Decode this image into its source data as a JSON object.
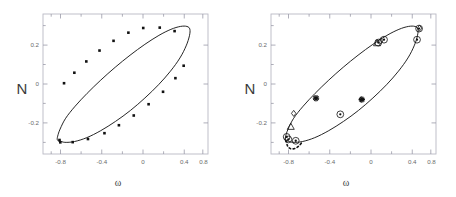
{
  "figure": {
    "background_color": "#ffffff",
    "panel_count": 2,
    "frame_color": "#b9b9c4",
    "curve_color": "#1a1a1a",
    "tick_color": "#9a9aa8",
    "text_color": "#4a4a4a"
  },
  "chart_data": [
    {
      "type": "scatter",
      "panel": "left",
      "title": "",
      "xlabel": "ω",
      "ylabel": "N",
      "xlim": [
        -1.0,
        1.0
      ],
      "ylim": [
        -0.36,
        0.36
      ],
      "xticks": [
        -0.8,
        -0.4,
        0,
        0.4,
        0.8
      ],
      "xticklabels": [
        "-0.8",
        "-0.4",
        "0",
        "0.4",
        "0.8"
      ],
      "yticks": [
        -0.2,
        0,
        0.2
      ],
      "yticklabels": [
        "-0.2",
        "0",
        "0.2"
      ],
      "grid": false,
      "frame": true,
      "minor_ticks": true,
      "series": [
        {
          "name": "limit-cycle-orbit",
          "kind": "closed-curve",
          "linestyle": "solid",
          "color": "#1a1a1a",
          "x": [
            -0.795,
            -0.735,
            -0.62,
            -0.47,
            -0.3,
            -0.12,
            0.06,
            0.235,
            0.4,
            0.545,
            0.66,
            0.735,
            0.775,
            0.78,
            0.745,
            0.665,
            0.55,
            0.405,
            0.235,
            0.055,
            -0.125,
            -0.3,
            -0.465,
            -0.61,
            -0.725,
            -0.793,
            -0.822,
            -0.827,
            -0.812
          ],
          "y": [
            -0.293,
            -0.3,
            -0.296,
            -0.276,
            -0.24,
            -0.192,
            -0.136,
            -0.072,
            -0.004,
            0.066,
            0.134,
            0.196,
            0.248,
            0.282,
            0.296,
            0.296,
            0.281,
            0.25,
            0.204,
            0.148,
            0.086,
            0.02,
            -0.048,
            -0.114,
            -0.176,
            -0.232,
            -0.268,
            -0.286,
            -0.293
          ]
        },
        {
          "name": "sampled-points",
          "kind": "markers",
          "marker": "filled-square",
          "color": "#111111",
          "size": 2.6,
          "x": [
            -0.8,
            -0.79,
            -0.64,
            -0.455,
            -0.255,
            -0.08,
            0.1,
            0.28,
            0.455,
            0.605,
            0.705,
            0.595,
            0.415,
            0.215,
            0.035,
            -0.145,
            -0.315,
            -0.475,
            -0.62,
            -0.745
          ],
          "y": [
            -0.288,
            -0.3,
            -0.299,
            -0.283,
            -0.253,
            -0.212,
            -0.162,
            -0.104,
            -0.04,
            0.03,
            0.094,
            0.272,
            0.29,
            0.288,
            0.264,
            0.222,
            0.172,
            0.116,
            0.058,
            0.004
          ]
        }
      ]
    },
    {
      "type": "scatter",
      "panel": "right",
      "title": "",
      "xlabel": "ω",
      "ylabel": "N",
      "xlim": [
        -1.0,
        1.0
      ],
      "ylim": [
        -0.36,
        0.36
      ],
      "xticks": [
        -0.8,
        -0.4,
        0,
        0.4,
        0.8
      ],
      "xticklabels": [
        "-0.8",
        "-0.4",
        "0",
        "0.4",
        "0.8"
      ],
      "yticks": [
        -0.2,
        0,
        0.2
      ],
      "yticklabels": [
        "-0.2",
        "0",
        "0.2"
      ],
      "grid": false,
      "frame": true,
      "minor_ticks": true,
      "series": [
        {
          "name": "limit-cycle-orbit",
          "kind": "closed-curve",
          "linestyle": "solid",
          "color": "#1a1a1a",
          "x": [
            -0.795,
            -0.735,
            -0.62,
            -0.47,
            -0.3,
            -0.12,
            0.06,
            0.235,
            0.4,
            0.545,
            0.66,
            0.735,
            0.775,
            0.78,
            0.745,
            0.665,
            0.55,
            0.405,
            0.235,
            0.055,
            -0.125,
            -0.3,
            -0.465,
            -0.61,
            -0.725,
            -0.793,
            -0.822,
            -0.827,
            -0.812
          ],
          "y": [
            -0.293,
            -0.3,
            -0.296,
            -0.276,
            -0.24,
            -0.192,
            -0.136,
            -0.072,
            -0.004,
            0.066,
            0.134,
            0.196,
            0.248,
            0.282,
            0.296,
            0.296,
            0.281,
            0.25,
            0.204,
            0.148,
            0.086,
            0.02,
            -0.048,
            -0.114,
            -0.176,
            -0.232,
            -0.268,
            -0.286,
            -0.293
          ]
        },
        {
          "name": "transient-approach",
          "kind": "open-curve",
          "linestyle": "dashed",
          "color": "#111111",
          "x": [
            -0.82,
            -0.8,
            -0.775,
            -0.74,
            -0.7,
            -0.66,
            -0.625
          ],
          "y": [
            -0.29,
            -0.318,
            -0.33,
            -0.334,
            -0.33,
            -0.318,
            -0.3
          ]
        },
        {
          "name": "star-markers",
          "kind": "markers",
          "marker": "star",
          "color": "#111111",
          "size": 3.2,
          "x": [
            -0.455,
            0.1
          ],
          "y": [
            -0.073,
            -0.08
          ]
        },
        {
          "name": "circle-dot-markers",
          "kind": "markers",
          "marker": "circle-dot",
          "color": "#111111",
          "size": 3.4,
          "x": [
            -0.79,
            -0.7,
            -0.16,
            0.3,
            0.37,
            0.77,
            0.795,
            -0.81
          ],
          "y": [
            -0.285,
            -0.292,
            -0.156,
            0.213,
            0.228,
            0.228,
            0.285,
            -0.272
          ]
        },
        {
          "name": "triangle-markers",
          "kind": "markers",
          "marker": "triangle-up",
          "color": "#111111",
          "size": 4.0,
          "x": [
            -0.76,
            0.285
          ],
          "y": [
            -0.222,
            0.208
          ]
        },
        {
          "name": "diamond-markers",
          "kind": "markers",
          "marker": "diamond",
          "color": "#111111",
          "size": 3.0,
          "x": [
            -0.725,
            0.33,
            0.8
          ],
          "y": [
            -0.151,
            0.222,
            0.287
          ]
        }
      ]
    }
  ],
  "panels": {
    "left": {
      "id": "panel-left",
      "ylabel": "N",
      "xlabel": "ω",
      "xticklabels": [
        "-0.8",
        "-0.4",
        "0",
        "0.4",
        "0.8"
      ],
      "yticklabels": [
        "0.2",
        "0",
        "-0.2"
      ]
    },
    "right": {
      "id": "panel-right",
      "ylabel": "N",
      "xlabel": "ω",
      "xticklabels": [
        "-0.8",
        "-0.4",
        "0",
        "0.4",
        "0.8"
      ],
      "yticklabels": [
        "0.2",
        "0",
        "-0.2"
      ]
    }
  }
}
